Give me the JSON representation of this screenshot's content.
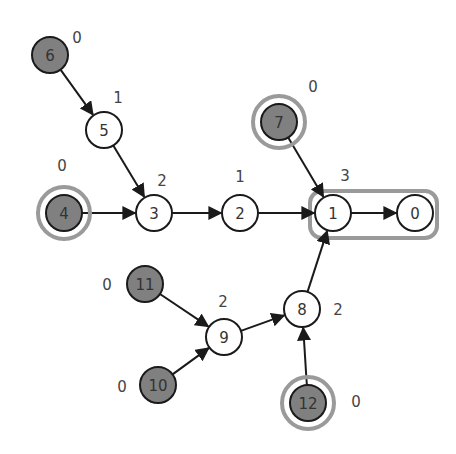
{
  "diagram": {
    "type": "directed-graph",
    "colors": {
      "node_fill_plain": "#ffffff",
      "node_fill_leaf": "#808080",
      "node_stroke": "#1a1a1a",
      "highlight_ring": "#9a9a9a",
      "edge": "#1a1a1a",
      "text": "#333333"
    },
    "nodes": [
      {
        "id": "0",
        "x": 415,
        "y": 213,
        "filled": false,
        "ring": false,
        "weight": null,
        "wx": 0,
        "wy": 0
      },
      {
        "id": "1",
        "x": 333,
        "y": 213,
        "filled": false,
        "ring": false,
        "weight": "3",
        "wx": 345,
        "wy": 176
      },
      {
        "id": "2",
        "x": 240,
        "y": 213,
        "filled": false,
        "ring": false,
        "weight": "1",
        "wx": 240,
        "wy": 177
      },
      {
        "id": "3",
        "x": 154,
        "y": 213,
        "filled": false,
        "ring": false,
        "weight": "2",
        "wx": 162,
        "wy": 181
      },
      {
        "id": "4",
        "x": 64,
        "y": 213,
        "filled": true,
        "ring": true,
        "weight": "0",
        "wx": 62,
        "wy": 166
      },
      {
        "id": "5",
        "x": 104,
        "y": 130,
        "filled": false,
        "ring": false,
        "weight": "1",
        "wx": 118,
        "wy": 98
      },
      {
        "id": "6",
        "x": 50,
        "y": 55,
        "filled": true,
        "ring": false,
        "weight": "0",
        "wx": 77,
        "wy": 38
      },
      {
        "id": "7",
        "x": 279,
        "y": 122,
        "filled": true,
        "ring": true,
        "weight": "0",
        "wx": 313,
        "wy": 87
      },
      {
        "id": "8",
        "x": 302,
        "y": 309,
        "filled": false,
        "ring": false,
        "weight": "2",
        "wx": 338,
        "wy": 310
      },
      {
        "id": "9",
        "x": 224,
        "y": 337,
        "filled": false,
        "ring": false,
        "weight": "2",
        "wx": 223,
        "wy": 302
      },
      {
        "id": "10",
        "x": 158,
        "y": 385,
        "filled": true,
        "ring": false,
        "weight": "0",
        "wx": 122,
        "wy": 387
      },
      {
        "id": "11",
        "x": 145,
        "y": 284,
        "filled": true,
        "ring": false,
        "weight": "0",
        "wx": 107,
        "wy": 285
      },
      {
        "id": "12",
        "x": 308,
        "y": 403,
        "filled": true,
        "ring": true,
        "weight": "0",
        "wx": 356,
        "wy": 402
      }
    ],
    "edges": [
      {
        "from": "6",
        "to": "5"
      },
      {
        "from": "5",
        "to": "3"
      },
      {
        "from": "4",
        "to": "3"
      },
      {
        "from": "3",
        "to": "2"
      },
      {
        "from": "2",
        "to": "1"
      },
      {
        "from": "7",
        "to": "1"
      },
      {
        "from": "1",
        "to": "0"
      },
      {
        "from": "8",
        "to": "1"
      },
      {
        "from": "9",
        "to": "8"
      },
      {
        "from": "11",
        "to": "9"
      },
      {
        "from": "10",
        "to": "9"
      },
      {
        "from": "12",
        "to": "8"
      }
    ],
    "highlight_group": {
      "members": [
        "1",
        "0"
      ],
      "x": 310,
      "y": 191,
      "w": 127,
      "h": 47,
      "rx": 12
    }
  }
}
